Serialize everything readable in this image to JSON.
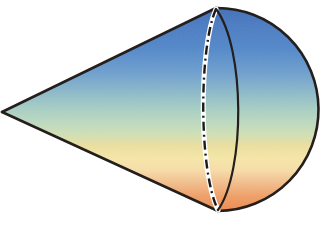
{
  "figure": {
    "title": "Cone with spherical cap",
    "background_color": "#ffffff",
    "width": 329,
    "height": 230
  },
  "geometry": {
    "apex": {
      "x": 2,
      "y": 112,
      "label": "cone-apex"
    },
    "top_junction": {
      "x": 216,
      "y": 8,
      "label": "upper-tangent-point"
    },
    "bottom_junction": {
      "x": 218,
      "y": 211,
      "label": "lower-tangent-point"
    },
    "cap_right_extent": {
      "x": 318,
      "y": 110,
      "label": "sphere-cap-rightmost"
    },
    "front_rim_bulge_x": 238,
    "back_rim_bulge_x": 203,
    "base_center": {
      "x": 217,
      "y": 109
    }
  },
  "strokes": {
    "outline_color": "#241f1c",
    "outline_width": 2.6,
    "hidden_edge_color": "#1b1a18",
    "hidden_edge_width": 2.4,
    "hidden_edge_dash_pattern": "9 4 2 4",
    "hidden_edge_halo_color": "#ffffff",
    "hidden_edge_halo_width": 5.0,
    "front_rim_width": 2.2
  },
  "gradient": {
    "name": "vertical-spectrum-fill",
    "direction": "top-to-bottom",
    "stops": [
      {
        "offset": "0%",
        "color": "#3f6fb8",
        "name": "deep-blue"
      },
      {
        "offset": "8%",
        "color": "#4a7cc2",
        "name": "blue"
      },
      {
        "offset": "20%",
        "color": "#5289ca",
        "name": "mid-blue"
      },
      {
        "offset": "32%",
        "color": "#6fa0cf",
        "name": "light-blue"
      },
      {
        "offset": "42%",
        "color": "#8fbbc9",
        "name": "blue-teal"
      },
      {
        "offset": "50%",
        "color": "#a9cfc4",
        "name": "teal"
      },
      {
        "offset": "56%",
        "color": "#bcd9c0",
        "name": "pale-green"
      },
      {
        "offset": "62%",
        "color": "#cfe0b6",
        "name": "green-yellow"
      },
      {
        "offset": "68%",
        "color": "#ecdf9f",
        "name": "pale-yellow"
      },
      {
        "offset": "74%",
        "color": "#f6e7a8",
        "name": "cream-yellow"
      },
      {
        "offset": "80%",
        "color": "#f7ddaa",
        "name": "cream"
      },
      {
        "offset": "86%",
        "color": "#f2bf8e",
        "name": "light-orange"
      },
      {
        "offset": "93%",
        "color": "#ef9f66",
        "name": "orange"
      },
      {
        "offset": "100%",
        "color": "#ef8a4e",
        "name": "deep-orange"
      }
    ]
  },
  "elements": {
    "cone_body_name": "cone-body",
    "cap_name": "spherical-cap",
    "upper_edge_name": "cone-upper-edge",
    "lower_edge_name": "cone-lower-edge",
    "front_rim_name": "base-front-rim-arc",
    "hidden_rim_name": "base-hidden-rim-arc"
  },
  "labels": {
    "caption": ""
  }
}
